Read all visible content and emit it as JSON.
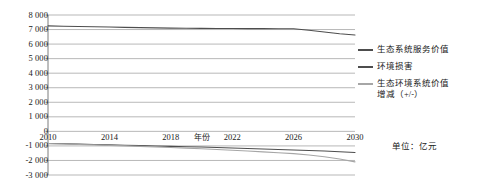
{
  "chart_data": {
    "type": "line",
    "title": "",
    "xlabel": "年份",
    "ylabel": "",
    "unit_note": "单位：亿元",
    "x": [
      2010,
      2011,
      2012,
      2013,
      2014,
      2015,
      2016,
      2017,
      2018,
      2019,
      2020,
      2021,
      2022,
      2023,
      2024,
      2025,
      2026,
      2027,
      2028,
      2029,
      2030
    ],
    "xlim": [
      2010,
      2030
    ],
    "ylim": [
      -3000,
      8000
    ],
    "xticks": [
      2010,
      2014,
      2018,
      2022,
      2026,
      2030
    ],
    "yticks": [
      8000,
      7000,
      6000,
      5000,
      4000,
      3000,
      2000,
      1000,
      0,
      -1000,
      -2000,
      -3000
    ],
    "ytick_labels": [
      "8 000",
      "7 000",
      "6 000",
      "5 000",
      "4 000",
      "3 000",
      "2 000",
      "1 000",
      "0",
      "-1 000",
      "-2 000",
      "-3 000"
    ],
    "xtick_labels": [
      "2010",
      "2014",
      "2018",
      "2022",
      "2026",
      "2030"
    ],
    "grid": true,
    "legend_position": "right",
    "series": [
      {
        "name": "生态系统服务价值",
        "color": "#4d4d4d",
        "values": [
          7250,
          7230,
          7210,
          7190,
          7170,
          7150,
          7130,
          7115,
          7100,
          7090,
          7080,
          7075,
          7070,
          7065,
          7060,
          7055,
          7050,
          6950,
          6830,
          6710,
          6620
        ]
      },
      {
        "name": "环境损害",
        "color": "#4d4d4d",
        "values": [
          -830,
          -855,
          -880,
          -905,
          -930,
          -955,
          -980,
          -1005,
          -1030,
          -1055,
          -1080,
          -1110,
          -1140,
          -1175,
          -1210,
          -1245,
          -1280,
          -1315,
          -1350,
          -1400,
          -1450
        ]
      },
      {
        "name": "生态环境系统价值增减（+/-）",
        "legend_label": "生态环境系统价值\n增减（+/-）",
        "color": "#a6a6a6",
        "values": [
          -840,
          -870,
          -900,
          -930,
          -960,
          -995,
          -1030,
          -1070,
          -1110,
          -1155,
          -1200,
          -1250,
          -1300,
          -1355,
          -1410,
          -1470,
          -1530,
          -1630,
          -1740,
          -1900,
          -2100
        ]
      }
    ]
  },
  "legend": {
    "items": [
      {
        "label": "生态系统服务价值"
      },
      {
        "label": "环境损害"
      },
      {
        "label": "生态环境系统价值\n增减（+/-）"
      }
    ]
  },
  "footer": {
    "unit": "单位：亿元"
  },
  "colors": {
    "axis": "#6e6e6e",
    "grid": "#9a9a9a",
    "series_dark": "#4d4d4d",
    "series_light": "#a6a6a6",
    "text": "#1a1a1a"
  }
}
